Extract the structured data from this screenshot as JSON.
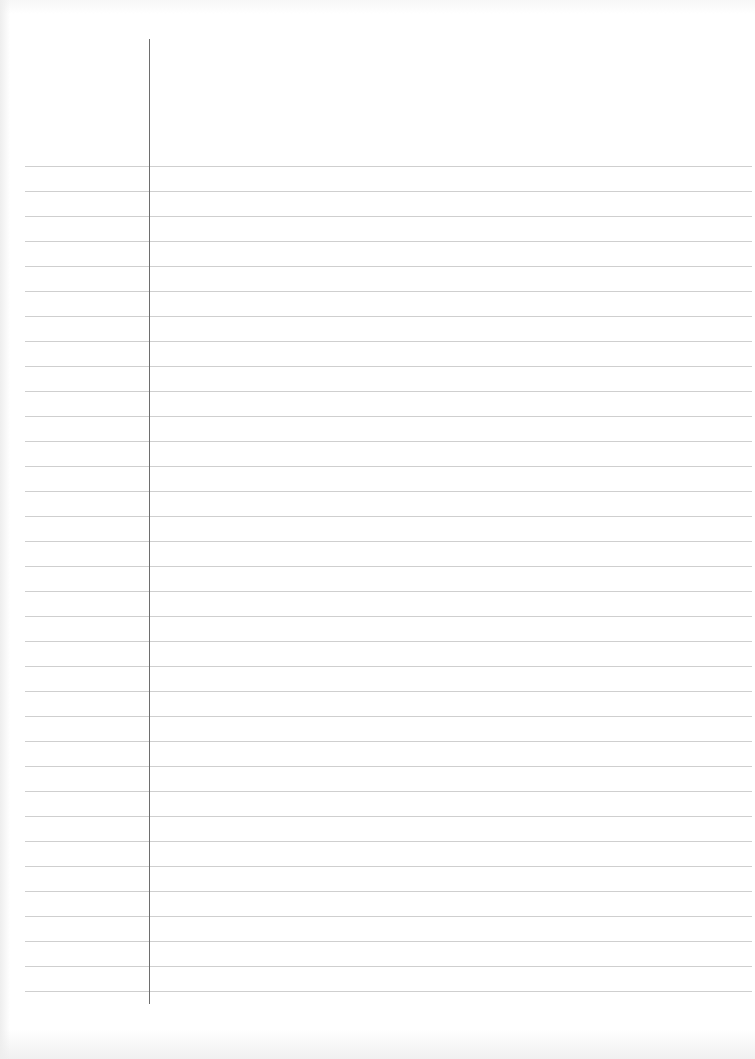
{
  "document": {
    "type": "lined notebook paper",
    "paper_color": "#ffffff",
    "rule_color": "#cfcfcf",
    "margin_line_color": "#6e6e6e",
    "rules": {
      "count": 34,
      "first_y": 166,
      "spacing": 25,
      "x_start": 25,
      "x_end": 752
    },
    "margin_line": {
      "x": 149,
      "y_start": 39,
      "y_end": 1004
    },
    "text": ""
  }
}
